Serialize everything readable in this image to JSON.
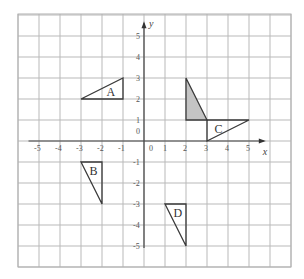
{
  "grid": {
    "x_min_line": -6,
    "x_max_line": 7,
    "y_min_line": -6,
    "y_max_line": 6,
    "origin_px": [
      144,
      141
    ],
    "unit_px": 21,
    "left_px": 18,
    "right_px": 291,
    "top_px": 14,
    "bottom_px": 267
  },
  "axes": {
    "x_label": "x",
    "y_label": "y",
    "x_ticks": [
      "-5",
      "-4",
      "-3",
      "-2",
      "-1",
      "0",
      "1",
      "2",
      "3",
      "4",
      "5"
    ],
    "x_tick_values": [
      -5,
      -4,
      -3,
      -2,
      -1,
      0,
      1,
      2,
      3,
      4,
      5
    ],
    "y_ticks": [
      "5",
      "4",
      "3",
      "2",
      "1",
      "0",
      "-1",
      "-2",
      "-3",
      "-4",
      "-5"
    ],
    "y_tick_values": [
      5,
      4,
      3,
      2,
      1,
      0,
      -1,
      -2,
      -3,
      -4,
      -5
    ]
  },
  "shapes": {
    "shaded": {
      "label": "",
      "points": [
        [
          2,
          3
        ],
        [
          2,
          1
        ],
        [
          3,
          1
        ]
      ],
      "fill": "#c4c4c4"
    },
    "A": {
      "label": "A",
      "points": [
        [
          -3,
          2
        ],
        [
          -1,
          2
        ],
        [
          -1,
          3
        ]
      ],
      "label_at": [
        -1.6,
        2.35
      ]
    },
    "B": {
      "label": "B",
      "points": [
        [
          -3,
          -1
        ],
        [
          -2,
          -1
        ],
        [
          -2,
          -3
        ]
      ],
      "label_at": [
        -2.4,
        -1.45
      ]
    },
    "C": {
      "label": "C",
      "points": [
        [
          3,
          1
        ],
        [
          5,
          1
        ],
        [
          3,
          0
        ]
      ],
      "label_at": [
        3.55,
        0.55
      ]
    },
    "D": {
      "label": "D",
      "points": [
        [
          1,
          -3
        ],
        [
          2,
          -3
        ],
        [
          2,
          -5
        ]
      ],
      "label_at": [
        1.6,
        -3.45
      ]
    }
  }
}
